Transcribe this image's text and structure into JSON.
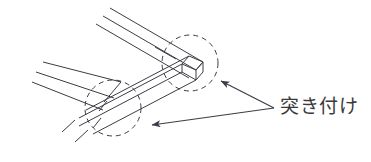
{
  "figure": {
    "kind": "isometric-line-diagram",
    "background_color": "#ffffff",
    "line_color": "#3c3c46",
    "text_color": "#3a3a3a",
    "width": 371,
    "height": 162
  },
  "annotations": {
    "joint_label": "突き付け",
    "label_position": {
      "x": 280,
      "y": 94
    },
    "leader_origin": {
      "x": 274,
      "y": 108
    }
  },
  "highlight_circles": [
    {
      "name": "corner-butt-joint-highlight",
      "cx": 190,
      "cy": 63,
      "r": 28,
      "style": "dashed"
    },
    {
      "name": "member-butt-joint-highlight",
      "cx": 113,
      "cy": 108,
      "r": 28,
      "style": "dashed"
    }
  ],
  "arrows": [
    {
      "name": "arrow-to-corner-joint",
      "from": {
        "x": 274,
        "y": 108
      },
      "to": {
        "x": 219,
        "y": 80
      }
    },
    {
      "name": "arrow-to-member-joint",
      "from": {
        "x": 274,
        "y": 108
      },
      "to": {
        "x": 148,
        "y": 126
      }
    }
  ],
  "members": [
    {
      "name": "upper-right-member",
      "direction": "up-right",
      "line_count": 3,
      "description": "Three parallel lines running to upper right, open-ended at top"
    },
    {
      "name": "lower-left-member",
      "direction": "down-left",
      "line_count": 3,
      "description": "Three parallel lines running to lower left, open-ended at left"
    },
    {
      "name": "corner-block",
      "description": "Solid rectangular end face at the right corner of the bent member"
    }
  ]
}
